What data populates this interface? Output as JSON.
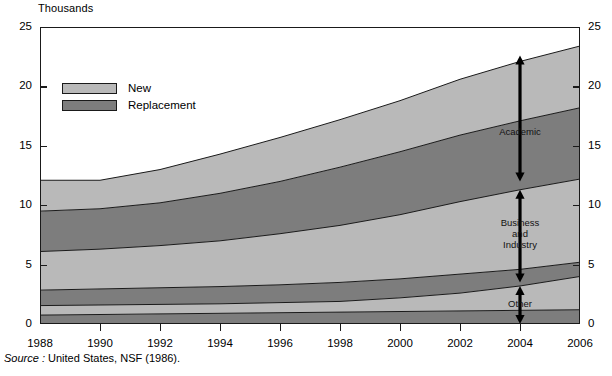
{
  "chart_data": {
    "type": "area",
    "title": "",
    "ylabel": "Thousands",
    "xlabel": "",
    "ylim": [
      0,
      25
    ],
    "xlim": [
      1988,
      2006
    ],
    "grid": false,
    "stacked": true,
    "legend_position": "upper-left-inside",
    "x": [
      1988,
      1990,
      1992,
      1994,
      1996,
      1998,
      2000,
      2002,
      2004,
      2006
    ],
    "y_ticks": [
      0,
      5,
      10,
      15,
      20,
      25
    ],
    "x_ticks": [
      1988,
      1990,
      1992,
      1994,
      1996,
      1998,
      2000,
      2002,
      2004,
      2006
    ],
    "series": [
      {
        "name": "Other - Replacement",
        "sector": "Other",
        "kind": "Replacement",
        "values": [
          0.75,
          0.8,
          0.85,
          0.9,
          0.95,
          1.0,
          1.05,
          1.1,
          1.15,
          1.2
        ]
      },
      {
        "name": "Other - New",
        "sector": "Other",
        "kind": "New",
        "values": [
          1.55,
          1.6,
          1.65,
          1.7,
          1.8,
          1.9,
          2.2,
          2.6,
          3.2,
          4.0
        ]
      },
      {
        "name": "Business and Industry - Replacement",
        "sector": "Business and Industry",
        "kind": "Replacement",
        "values": [
          2.85,
          2.95,
          3.05,
          3.15,
          3.3,
          3.5,
          3.8,
          4.2,
          4.6,
          5.2
        ]
      },
      {
        "name": "Business and Industry - New",
        "sector": "Business and Industry",
        "kind": "New",
        "values": [
          6.1,
          6.3,
          6.6,
          7.0,
          7.6,
          8.3,
          9.2,
          10.3,
          11.3,
          12.2
        ]
      },
      {
        "name": "Academic - Replacement",
        "sector": "Academic",
        "kind": "Replacement",
        "values": [
          9.5,
          9.7,
          10.2,
          11.0,
          12.0,
          13.2,
          14.5,
          15.9,
          17.1,
          18.2
        ]
      },
      {
        "name": "Academic - New",
        "sector": "Academic",
        "kind": "New",
        "values": [
          12.1,
          12.1,
          13.0,
          14.3,
          15.7,
          17.2,
          18.8,
          20.6,
          22.1,
          23.4
        ]
      }
    ],
    "annotations": [
      {
        "label": "Academic",
        "x": 2004,
        "from": 12.0,
        "to": 22.6
      },
      {
        "label": "Business\nand\nIndustry",
        "x": 2004,
        "from": 3.5,
        "to": 11.3
      },
      {
        "label": "Other",
        "x": 2004,
        "from": 0.0,
        "to": 3.2
      }
    ],
    "colors": {
      "new": "#b9b9b9",
      "replacement": "#7d7d7d",
      "line": "#1a1a1a",
      "background": "#ffffff"
    }
  },
  "axis": {
    "y_title": "Thousands",
    "y_labels": [
      "25",
      "20",
      "15",
      "10",
      "5",
      "0"
    ],
    "x_labels": [
      "1988",
      "1990",
      "1992",
      "1994",
      "1996",
      "1998",
      "2000",
      "2002",
      "2004",
      "2006"
    ]
  },
  "legend": {
    "items": [
      {
        "label": "New",
        "color": "#b9b9b9"
      },
      {
        "label": "Replacement",
        "color": "#7d7d7d"
      }
    ]
  },
  "annotations": {
    "academic": "Academic",
    "business_line1": "Business",
    "business_line2": "and",
    "business_line3": "Industry",
    "other": "Other"
  },
  "source": {
    "prefix": "Source :",
    "text": "United States, NSF  (1986)."
  }
}
